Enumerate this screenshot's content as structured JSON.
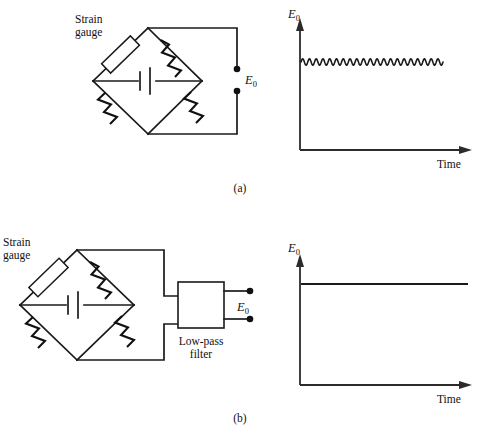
{
  "figure": {
    "background": "#ffffff",
    "ink": "#1a1a1a",
    "panels": [
      {
        "caption": "(a)",
        "caption_x": 240,
        "caption_y": 192,
        "circuit": {
          "strain_gauge_label_line1": "Strain",
          "strain_gauge_label_line2": "gauge",
          "output_label": "E",
          "output_label_sub": "0"
        },
        "plot": {
          "ylabel": "E",
          "ylabel_sub": "0",
          "xlabel": "Time"
        }
      },
      {
        "caption": "(b)",
        "caption_x": 240,
        "caption_y": 422,
        "circuit": {
          "strain_gauge_label_line1": "Strain",
          "strain_gauge_label_line2": "gauge",
          "filter_label_line1": "Low-pass",
          "filter_label_line2": "filter",
          "output_label": "E",
          "output_label_sub": "0"
        },
        "plot": {
          "ylabel": "E",
          "ylabel_sub": "0",
          "xlabel": "Time"
        }
      }
    ]
  },
  "chart_data": [
    {
      "type": "line",
      "title": "",
      "xlabel": "Time",
      "ylabel": "E0",
      "description": "Unfiltered bridge output: steady DC level with superimposed high-frequency ripple noise",
      "axis": {
        "x0": 300,
        "y0": 150,
        "x1": 472,
        "y1": 22
      },
      "baseline_value": 62,
      "ripple_amplitude": 3.2,
      "ripple_cycles": 21,
      "trace_x_start": 301,
      "trace_x_end": 443,
      "grid": false,
      "legend": false
    },
    {
      "type": "line",
      "title": "",
      "xlabel": "Time",
      "ylabel": "E0",
      "description": "Filtered output: smooth constant DC level with ripple removed",
      "axis": {
        "x0": 300,
        "y0": 385,
        "x1": 472,
        "y1": 258
      },
      "baseline_value": 284,
      "ripple_amplitude": 0,
      "ripple_cycles": 0,
      "trace_x_start": 301,
      "trace_x_end": 468,
      "grid": false,
      "legend": false
    }
  ]
}
